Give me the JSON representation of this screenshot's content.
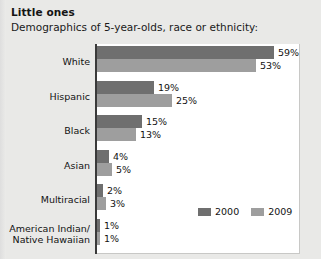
{
  "chart_data": {
    "type": "bar",
    "title": "Little ones",
    "subtitle": "Demographics of 5-year-olds, race or ethnicity:",
    "orientation": "horizontal",
    "xlabel": "",
    "ylabel": "",
    "xlim": [
      0,
      65
    ],
    "grid": false,
    "legend_position": "bottom-right",
    "categories": [
      "White",
      "Hispanic",
      "Black",
      "Asian",
      "Multiracial",
      "American Indian/\nNative Hawaiian"
    ],
    "series": [
      {
        "name": "2000",
        "color": "#6f6f6f",
        "values": [
          59,
          19,
          15,
          4,
          2,
          1
        ]
      },
      {
        "name": "2009",
        "color": "#9e9e9e",
        "values": [
          53,
          25,
          13,
          5,
          3,
          1
        ]
      }
    ],
    "value_labels": {
      "2000": [
        "59%",
        "19%",
        "15%",
        "4%",
        "2%",
        "1%"
      ],
      "2009": [
        "53%",
        "25%",
        "13%",
        "5%",
        "3%",
        "1%"
      ]
    }
  },
  "rows": [
    {
      "label_line1": "White",
      "label_line2": "",
      "v2000": 59,
      "v2009": 53,
      "l2000": "59%",
      "l2009": "53%"
    },
    {
      "label_line1": "Hispanic",
      "label_line2": "",
      "v2000": 19,
      "v2009": 25,
      "l2000": "19%",
      "l2009": "25%"
    },
    {
      "label_line1": "Black",
      "label_line2": "",
      "v2000": 15,
      "v2009": 13,
      "l2000": "15%",
      "l2009": "13%"
    },
    {
      "label_line1": "Asian",
      "label_line2": "",
      "v2000": 4,
      "v2009": 5,
      "l2000": "4%",
      "l2009": "5%"
    },
    {
      "label_line1": "Multiracial",
      "label_line2": "",
      "v2000": 2,
      "v2009": 3,
      "l2000": "2%",
      "l2009": "3%"
    },
    {
      "label_line1": "American Indian/",
      "label_line2": "Native Hawaiian",
      "v2000": 1,
      "v2009": 1,
      "l2000": "1%",
      "l2009": "1%"
    }
  ],
  "legend": [
    {
      "label": "2000",
      "color": "#6f6f6f"
    },
    {
      "label": "2009",
      "color": "#9e9e9e"
    }
  ],
  "colors": {
    "series_2000": "#6f6f6f",
    "series_2009": "#9e9e9e",
    "page_background": "#e9e9e7",
    "panel_background": "#ffffff",
    "axis": "#3a3a3a",
    "text": "#121212"
  },
  "scale": {
    "pixels_per_percent": 3.0
  }
}
